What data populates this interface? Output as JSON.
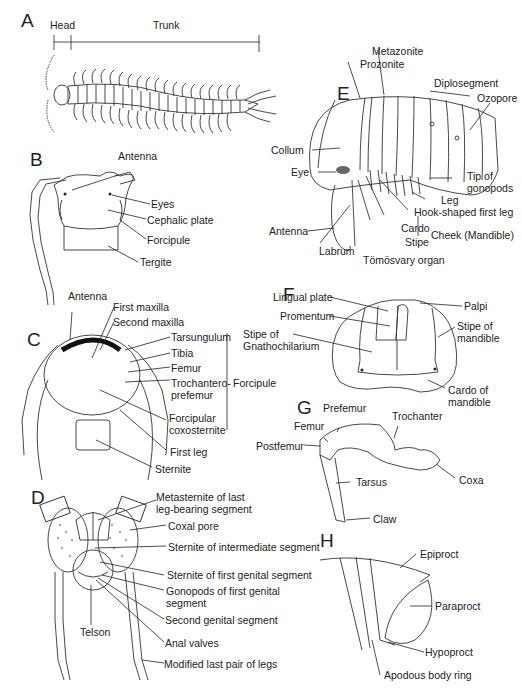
{
  "figure": {
    "panels": [
      {
        "id": "A",
        "labels": [
          "Head",
          "Trunk"
        ]
      },
      {
        "id": "B",
        "labels": [
          "Antenna",
          "Eyes",
          "Cephalic plate",
          "Forcipule",
          "Tergite"
        ]
      },
      {
        "id": "C",
        "labels": [
          "Antenna",
          "First maxilla",
          "Second maxilla",
          "Tarsungulum",
          "Tibia",
          "Femur",
          "Trochantero-prefemur",
          "Forcipular coxosternite",
          "First leg",
          "Sternite",
          "Forcipule"
        ]
      },
      {
        "id": "D",
        "labels": [
          "Metasternite of last leg-bearing segment",
          "Coxal pore",
          "Sternite of intermediate segment",
          "Sternite of first genital segment",
          "Gonopods of first genital segment",
          "Second genital segment",
          "Telson",
          "Anal valves",
          "Modified last pair of legs"
        ]
      },
      {
        "id": "E",
        "labels": [
          "Metazonite",
          "Prozonite",
          "Diplosegment",
          "Ozopore",
          "Collum",
          "Eye",
          "Tip of gonopods",
          "Leg",
          "Hook-shaped first leg",
          "Antenna",
          "Labrum",
          "Cardo",
          "Stipe",
          "Cheek (Mandible)",
          "Tömösvary organ"
        ]
      },
      {
        "id": "F",
        "labels": [
          "Lingual plate",
          "Palpi",
          "Promentum",
          "Stipe of Gnathochilarium",
          "Stipe of mandible",
          "Cardo of mandible"
        ]
      },
      {
        "id": "G",
        "labels": [
          "Prefemur",
          "Trochanter",
          "Femur",
          "Postfemur",
          "Tarsus",
          "Coxa",
          "Claw"
        ]
      },
      {
        "id": "H",
        "labels": [
          "Epiproct",
          "Paraproct",
          "Hypoproct",
          "Apodous body ring"
        ]
      }
    ]
  },
  "A": {
    "letter": "A",
    "head": "Head",
    "trunk": "Trunk"
  },
  "B": {
    "letter": "B",
    "antenna": "Antenna",
    "eyes": "Eyes",
    "cephalic_plate": "Cephalic plate",
    "forcipule": "Forcipule",
    "tergite": "Tergite"
  },
  "C": {
    "letter": "C",
    "antenna": "Antenna",
    "first_maxilla": "First maxilla",
    "second_maxilla": "Second maxilla",
    "tarsungulum": "Tarsungulum",
    "tibia": "Tibia",
    "femur": "Femur",
    "trochantero_1": "Trochantero-",
    "trochantero_2": "prefemur",
    "forcipular_1": "Forcipular",
    "forcipular_2": "coxosternite",
    "first_leg": "First leg",
    "sternite": "Sternite",
    "forcipule": "Forcipule"
  },
  "D": {
    "letter": "D",
    "metasternite_1": "Metasternite of last",
    "metasternite_2": "leg-bearing segment",
    "coxal_pore": "Coxal pore",
    "sternite_intermediate": "Sternite of intermediate segment",
    "sternite_first_genital": "Sternite of first genital segment",
    "gonopods_1": "Gonopods of first genital",
    "gonopods_2": "segment",
    "second_genital": "Second genital segment",
    "telson": "Telson",
    "anal_valves": "Anal valves",
    "modified_legs": "Modified last pair of legs"
  },
  "E": {
    "letter": "E",
    "metazonite": "Metazonite",
    "prozonite": "Prozonite",
    "diplosegment": "Diplosegment",
    "ozopore": "Ozopore",
    "collum": "Collum",
    "eye": "Eye",
    "tip_1": "Tip of",
    "tip_2": "gonopods",
    "leg": "Leg",
    "hook_leg": "Hook-shaped first leg",
    "antenna": "Antenna",
    "labrum": "Labrum",
    "cardo": "Cardo",
    "stipe": "Stipe",
    "cheek": "Cheek (Mandible)",
    "tomosvary": "Tömösvary organ"
  },
  "F": {
    "letter": "F",
    "lingual_plate": "Lingual plate",
    "palpi": "Palpi",
    "promentum": "Promentum",
    "stipe_gn_1": "Stipe of",
    "stipe_gn_2": "Gnathochilarium",
    "stipe_mand_1": "Stipe of",
    "stipe_mand_2": "mandible",
    "cardo_mand_1": "Cardo of",
    "cardo_mand_2": "mandible"
  },
  "G": {
    "letter": "G",
    "prefemur": "Prefemur",
    "trochanter": "Trochanter",
    "femur": "Femur",
    "postfemur": "Postfemur",
    "tarsus": "Tarsus",
    "coxa": "Coxa",
    "claw": "Claw"
  },
  "H": {
    "letter": "H",
    "epiproct": "Epiproct",
    "paraproct": "Paraproct",
    "hypoproct": "Hypoproct",
    "apodous": "Apodous body ring"
  }
}
